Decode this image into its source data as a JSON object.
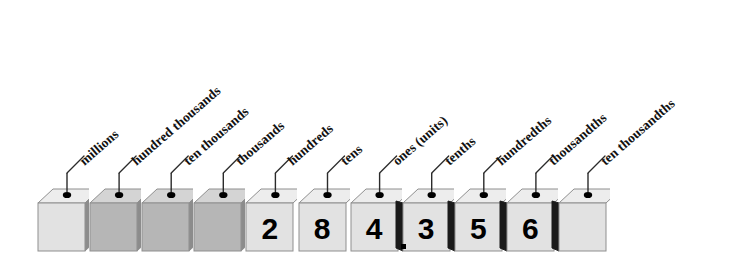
{
  "figure": {
    "number_shown": "284.356",
    "decimal_point": ".",
    "label_rotation_degrees": -41
  },
  "colors": {
    "cube_light_face": "#e2e2e2",
    "cube_light_top": "#ededed",
    "cube_dark_face": "#b6b6b6",
    "cube_dark_top": "#d4d4d4",
    "cube_side_shadow": "#8c8c8c",
    "cube_side_black": "#1a1a1a",
    "cube_border": "#8f8f8f",
    "digit_color": "#000000",
    "label_color": "#111111",
    "leader_line": "#2b2b2b",
    "pin_dot": "#000000",
    "background": "#ffffff"
  },
  "places": [
    {
      "index": 0,
      "label": "millions",
      "digit": "",
      "style": "light",
      "side": "right-gray"
    },
    {
      "index": 1,
      "label": "hundred thousands",
      "digit": "",
      "style": "dark",
      "side": "right-gray"
    },
    {
      "index": 2,
      "label": "ten thousands",
      "digit": "",
      "style": "dark",
      "side": "right-gray"
    },
    {
      "index": 3,
      "label": "thousands",
      "digit": "",
      "style": "dark",
      "side": "right-gray"
    },
    {
      "index": 4,
      "label": "hundreds",
      "digit": "2",
      "style": "light",
      "side": "none"
    },
    {
      "index": 5,
      "label": "tens",
      "digit": "8",
      "style": "light",
      "side": "none"
    },
    {
      "index": 6,
      "label": "ones (units)",
      "digit": "4",
      "style": "light",
      "side": "none"
    },
    {
      "index": 7,
      "label": "tenths",
      "digit": "3",
      "style": "light",
      "side": "left-black"
    },
    {
      "index": 8,
      "label": "hundredths",
      "digit": "5",
      "style": "light",
      "side": "left-black"
    },
    {
      "index": 9,
      "label": "thousandths",
      "digit": "6",
      "style": "light",
      "side": "left-black"
    },
    {
      "index": 10,
      "label": "ten thousandths",
      "digit": "",
      "style": "light",
      "side": "left-black"
    }
  ]
}
